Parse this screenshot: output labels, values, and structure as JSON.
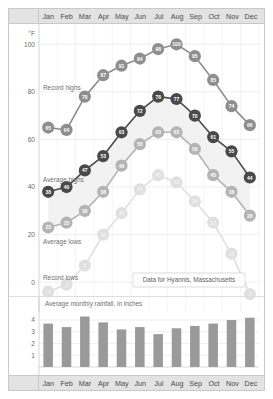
{
  "header": {
    "months": [
      "Jan",
      "Feb",
      "Mar",
      "Apr",
      "May",
      "Jun",
      "Jul",
      "Aug",
      "Sep",
      "Oct",
      "Nov",
      "Dec"
    ]
  },
  "footer": {
    "months": [
      "Jan",
      "Feb",
      "Mar",
      "Apr",
      "May",
      "Jun",
      "Jul",
      "Aug",
      "Sep",
      "Oct",
      "Nov",
      "Dec"
    ]
  },
  "callout": {
    "text": "Data for Hyannis, Massachusetts"
  },
  "chart_data": [
    {
      "type": "line",
      "title": "",
      "xlabel": "",
      "ylabel": "°F",
      "unit_label": "°F",
      "categories": [
        "Jan",
        "Feb",
        "Mar",
        "Apr",
        "May",
        "Jun",
        "Jul",
        "Aug",
        "Sep",
        "Oct",
        "Nov",
        "Dec"
      ],
      "ylim": [
        -10,
        106
      ],
      "yticks": [
        0,
        20,
        40,
        60,
        80,
        100
      ],
      "ytick_labels": [
        "0",
        "20",
        "40",
        "60",
        "80",
        "100"
      ],
      "grid": true,
      "legend": "inline-labels",
      "series": [
        {
          "name": "Record highs",
          "color": "#8e8e8e",
          "label_color": "#6f6f6f",
          "label_x": 34,
          "label_y": 66,
          "values": [
            65,
            64,
            78,
            87,
            91,
            94,
            98,
            100,
            95,
            85,
            74,
            66
          ]
        },
        {
          "name": "Average highs",
          "color": "#4a4a4a",
          "label_color": "#6f6f6f",
          "label_x": 34,
          "label_y": 158,
          "values": [
            38,
            40,
            47,
            53,
            63,
            72,
            78,
            77,
            70,
            61,
            55,
            44
          ]
        },
        {
          "name": "Average lows",
          "color": "#b4b4b4",
          "label_color": "#6f6f6f",
          "label_x": 34,
          "label_y": 220,
          "values": [
            23,
            25,
            30,
            38,
            49,
            58,
            63,
            63,
            56,
            45,
            38,
            28
          ]
        },
        {
          "name": "Record lows",
          "color": "#e0e0e0",
          "label_color": "#8a8a8a",
          "label_x": 34,
          "label_y": 256,
          "values": [
            -4,
            -1,
            7,
            20,
            29,
            39,
            45,
            42,
            34,
            25,
            12,
            -5
          ]
        }
      ]
    },
    {
      "type": "bar",
      "title": "Average monthly rainfall, in inches",
      "xlabel": "",
      "ylabel": "",
      "categories": [
        "Jan",
        "Feb",
        "Mar",
        "Apr",
        "May",
        "Jun",
        "Jul",
        "Aug",
        "Sep",
        "Oct",
        "Nov",
        "Dec"
      ],
      "values": [
        3.7,
        3.4,
        4.3,
        3.8,
        3.2,
        3.4,
        2.8,
        3.3,
        3.5,
        3.7,
        4.0,
        4.2
      ],
      "ylim": [
        0,
        4.6
      ],
      "yticks": [
        1,
        2,
        3,
        4
      ],
      "ytick_labels": [
        "1",
        "2",
        "3",
        "4"
      ],
      "bar_color": "#9a9a9a",
      "grid": true
    }
  ]
}
